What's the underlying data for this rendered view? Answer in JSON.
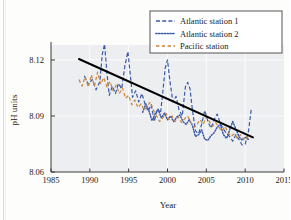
{
  "chart_data": {
    "type": "line",
    "title": "",
    "xlabel": "Year",
    "ylabel": "pH units",
    "xlim": [
      1985,
      2015
    ],
    "ylim": [
      8.06,
      8.128
    ],
    "xticks": [
      1985,
      1990,
      1995,
      2000,
      2005,
      2010,
      2015
    ],
    "yticks": [
      8.06,
      8.09,
      8.12
    ],
    "grid": true,
    "legend_position": "top-right",
    "plot_background": "#eceef0",
    "series": [
      {
        "name": "Atlantic station 1",
        "color": "#3a5aa8",
        "style": "dashed",
        "x": [
          1989.3,
          1989.8,
          1990.3,
          1990.8,
          1991.3,
          1991.6,
          1991.9,
          1992.2,
          1992.5,
          1992.9,
          1993.3,
          1993.7,
          1994.1,
          1994.5,
          1994.9,
          1995.2,
          1995.5,
          1995.9,
          1996.3,
          1996.7,
          1997.1,
          1997.5,
          1997.9,
          1998.3,
          1998.7,
          1999.1,
          1999.4,
          1999.7,
          2000.0,
          2000.3,
          2000.7,
          2001.1,
          2001.5,
          2001.9,
          2002.3,
          2002.6,
          2002.9,
          2003.2,
          2003.6,
          2004.0,
          2004.4,
          2004.8,
          2005.2,
          2005.6,
          2006.0,
          2006.4,
          2006.8,
          2007.2,
          2007.6,
          2008.0,
          2008.4,
          2008.8,
          2009.2,
          2009.6,
          2010.0,
          2010.4,
          2010.8
        ],
        "y": [
          8.1115,
          8.107,
          8.1095,
          8.104,
          8.1085,
          8.123,
          8.1285,
          8.113,
          8.101,
          8.106,
          8.102,
          8.1075,
          8.1045,
          8.1165,
          8.1245,
          8.1125,
          8.1,
          8.1035,
          8.0975,
          8.102,
          8.0965,
          8.0925,
          8.096,
          8.087,
          8.094,
          8.0915,
          8.103,
          8.1155,
          8.12,
          8.109,
          8.0975,
          8.1005,
          8.093,
          8.09,
          8.1055,
          8.108,
          8.1045,
          8.0935,
          8.082,
          8.0805,
          8.0855,
          8.093,
          8.087,
          8.0835,
          8.088,
          8.091,
          8.086,
          8.083,
          8.0805,
          8.079,
          8.0765,
          8.08,
          8.0775,
          8.0745,
          8.075,
          8.081,
          8.094
        ]
      },
      {
        "name": "Atlantic station 2",
        "color": "#3a5aa8",
        "style": "dotted",
        "x": [
          1996.8,
          1997.2,
          1997.6,
          1998.0,
          1998.4,
          1998.8,
          1999.2,
          1999.6,
          2000.0,
          2000.4,
          2000.8,
          2001.2,
          2001.6,
          2002.0,
          2002.4,
          2002.8,
          2003.2,
          2003.6,
          2004.0,
          2004.4,
          2004.8,
          2005.2,
          2005.6,
          2006.0,
          2006.4,
          2006.8,
          2007.2,
          2007.6,
          2008.0,
          2008.4,
          2008.8,
          2009.2,
          2009.6,
          2010.0,
          2010.4
        ],
        "y": [
          8.092,
          8.0965,
          8.093,
          8.0875,
          8.091,
          8.0935,
          8.089,
          8.0915,
          8.088,
          8.09,
          8.087,
          8.0895,
          8.0905,
          8.087,
          8.0855,
          8.088,
          8.085,
          8.079,
          8.08,
          8.0825,
          8.0775,
          8.077,
          8.0795,
          8.081,
          8.084,
          8.0855,
          8.08,
          8.078,
          8.0825,
          8.087,
          8.083,
          8.079,
          8.077,
          8.0785,
          8.0775
        ]
      },
      {
        "name": "Pacific station",
        "color": "#c8843c",
        "style": "dash",
        "x": [
          1988.6,
          1989.0,
          1989.4,
          1989.8,
          1990.2,
          1990.6,
          1991.0,
          1991.4,
          1991.8,
          1992.2,
          1992.6,
          1993.0,
          1993.4,
          1993.8,
          1994.2,
          1994.6,
          1995.0,
          1995.4,
          1995.8,
          1996.2,
          1996.6,
          1997.0,
          1997.4,
          1997.8,
          1998.2,
          1998.6,
          1999.0,
          1999.4,
          1999.8,
          2000.2,
          2000.6,
          2001.0,
          2001.4,
          2001.8,
          2002.2,
          2002.6,
          2003.0,
          2003.4,
          2003.8,
          2004.2,
          2004.6,
          2005.0,
          2005.4,
          2005.8,
          2006.2,
          2006.6,
          2007.0,
          2007.4,
          2007.8,
          2008.2,
          2008.6,
          2009.0,
          2009.4,
          2009.8,
          2010.2,
          2010.6
        ],
        "y": [
          8.1095,
          8.106,
          8.111,
          8.1055,
          8.112,
          8.106,
          8.1135,
          8.107,
          8.1105,
          8.1055,
          8.1085,
          8.1035,
          8.1065,
          8.102,
          8.105,
          8.0995,
          8.101,
          8.096,
          8.0985,
          8.0945,
          8.0965,
          8.093,
          8.0955,
          8.0975,
          8.093,
          8.09,
          8.087,
          8.089,
          8.0915,
          8.088,
          8.09,
          8.087,
          8.0895,
          8.0865,
          8.0885,
          8.09,
          8.0865,
          8.084,
          8.0855,
          8.088,
          8.0855,
          8.0895,
          8.087,
          8.0845,
          8.0865,
          8.084,
          8.082,
          8.0845,
          8.081,
          8.079,
          8.0805,
          8.078,
          8.08,
          8.0775,
          8.079,
          8.077
        ]
      }
    ],
    "trend_line": {
      "name": "linear trend",
      "color": "#000000",
      "x": [
        1988.6,
        2011.0
      ],
      "y": [
        8.1205,
        8.0785
      ]
    }
  },
  "legend": {
    "entries": [
      {
        "label": "Atlantic station 1"
      },
      {
        "label": "Atlantic station 2"
      },
      {
        "label": "Pacific station"
      }
    ]
  },
  "axes": {
    "y_title": "pH units",
    "x_title": "Year",
    "y_tick_labels": [
      "8.12",
      "8.09",
      "8.06"
    ],
    "x_tick_labels": [
      "1985",
      "1990",
      "1995",
      "2000",
      "2005",
      "2010",
      "2015"
    ]
  }
}
